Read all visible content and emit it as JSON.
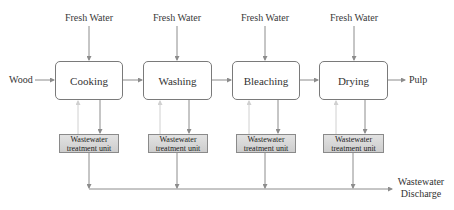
{
  "diagram": {
    "input_label": "Wood",
    "output_label": "Pulp",
    "fresh_water_label": "Fresh Water",
    "discharge_label_line1": "Wastewater",
    "discharge_label_line2": "Discharge",
    "processes": [
      {
        "label": "Cooking"
      },
      {
        "label": "Washing"
      },
      {
        "label": "Bleaching"
      },
      {
        "label": "Drying"
      }
    ],
    "treatment_units": [
      {
        "line1": "Wastewater",
        "line2": "treatment unit"
      },
      {
        "line1": "Wastewater",
        "line2": "treatment unit"
      },
      {
        "line1": "Wastewater",
        "line2": "treatment unit"
      },
      {
        "line1": "Wastewater",
        "line2": "treatment unit"
      }
    ],
    "fresh_water": [
      {
        "label": "Fresh Water"
      },
      {
        "label": "Fresh Water"
      },
      {
        "label": "Fresh Water"
      },
      {
        "label": "Fresh Water"
      }
    ],
    "colors": {
      "line": "#8c8c8c",
      "recycle_line": "#d0d0d0",
      "box_border": "#7a7a7a",
      "treatment_fill": "#d6d6d6"
    }
  }
}
